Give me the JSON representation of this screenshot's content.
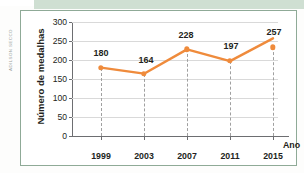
{
  "credit": "ADILSON SECCO",
  "colors": {
    "line": "#ef8b3c",
    "marker": "#ef8b3c",
    "frame": "#8faa97",
    "band": "#cfdfd2",
    "grid": "#d9d9d9",
    "axis": "#6d6e71",
    "text": "#231f20"
  },
  "chart_data": {
    "type": "line",
    "title": "",
    "xlabel": "Ano",
    "ylabel": "Número de medalhas",
    "categories": [
      "1999",
      "2003",
      "2007",
      "2011",
      "2015"
    ],
    "values": [
      180,
      164,
      228,
      197,
      257
    ],
    "point_labels": [
      "180",
      "164",
      "228",
      "197",
      "257"
    ],
    "ylim": [
      0,
      300
    ],
    "ytick_step": 50,
    "ytick_labels": [
      "300",
      "250",
      "200",
      "150",
      "100",
      "50",
      "0"
    ],
    "ytick_values": [
      300,
      250,
      200,
      150,
      100,
      50,
      0
    ],
    "grid": true,
    "legend": "none",
    "droplines": true,
    "marker": "circle"
  }
}
